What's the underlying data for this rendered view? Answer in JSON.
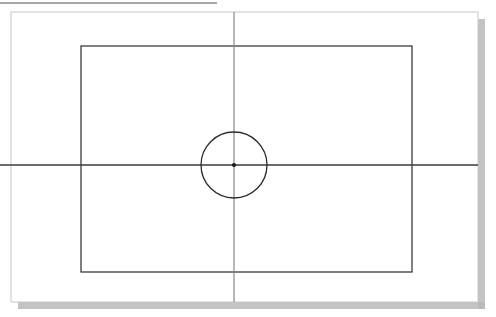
{
  "document": {
    "type": "technical-drawing",
    "title": "",
    "background_color": "#ffffff",
    "page_color": "#ffffff"
  },
  "drawing": {
    "top_rule": {
      "name": "top-horizontal-rule",
      "x1": 0,
      "y1": 3,
      "x2": 217,
      "y2": 3,
      "color": "#8a8a8a",
      "stroke_width": 1.4
    },
    "page_border": {
      "name": "page-border",
      "x": 11,
      "y": 12,
      "width": 467,
      "height": 290,
      "color": "#c8c8c8",
      "stroke_width": 1
    },
    "page_shadow": {
      "name": "page-drop-shadow",
      "color": "#b9b9b9",
      "offset_x": 7,
      "offset_y": 7,
      "thickness": 7
    },
    "inner_rectangle": {
      "name": "inner-rectangle",
      "x": 81,
      "y": 46,
      "width": 331,
      "height": 226,
      "color": "#2b2b2b",
      "stroke_width": 1.2
    },
    "horizontal_centerline": {
      "name": "horizontal-centerline",
      "x1": 0,
      "y1": 165,
      "x2": 478,
      "y2": 165,
      "color": "#3a3a3a",
      "stroke_width": 1.4
    },
    "vertical_centerline": {
      "name": "vertical-centerline",
      "x1": 234,
      "y1": 12,
      "x2": 234,
      "y2": 302,
      "color": "#888888",
      "stroke_width": 1.2
    },
    "circle": {
      "name": "center-circle",
      "cx": 234,
      "cy": 165,
      "r": 33,
      "color": "#2b2b2b",
      "stroke_width": 1.3,
      "fill": "none"
    },
    "center_point": {
      "name": "center-point-marker",
      "cx": 234,
      "cy": 165,
      "r": 2.1,
      "color": "#1a1a1a"
    }
  }
}
